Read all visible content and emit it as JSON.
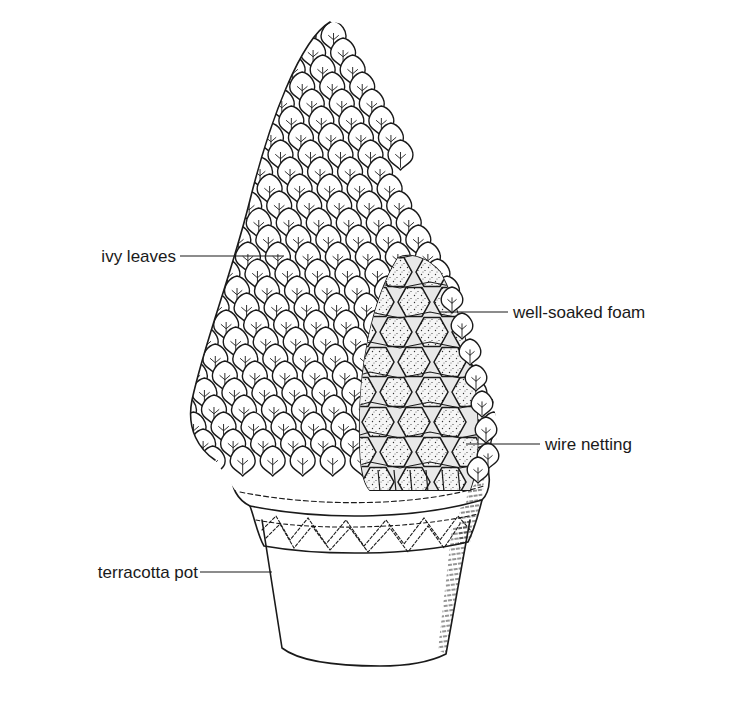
{
  "figure": {
    "colors": {
      "ink": "#1a1a1a",
      "background": "#ffffff",
      "foam_fill": "#f4f4f4"
    }
  },
  "labels": [
    {
      "id": "ivy-leaves",
      "text": "ivy leaves",
      "x": 176,
      "y": 262,
      "line_x1": 178,
      "line_x2": 268,
      "line_y": 256,
      "anchor": "end"
    },
    {
      "id": "well-soaked-foam",
      "text": "well-soaked foam",
      "x": 513,
      "y": 318,
      "line_x1": 440,
      "line_x2": 508,
      "line_y": 312,
      "anchor": "start"
    },
    {
      "id": "wire-netting",
      "text": "wire netting",
      "x": 545,
      "y": 450,
      "line_x1": 470,
      "line_x2": 540,
      "line_y": 444,
      "anchor": "start"
    },
    {
      "id": "terracotta-pot",
      "text": "terracotta pot",
      "x": 198,
      "y": 578,
      "line_x1": 200,
      "line_x2": 270,
      "line_y": 572,
      "anchor": "end"
    }
  ]
}
